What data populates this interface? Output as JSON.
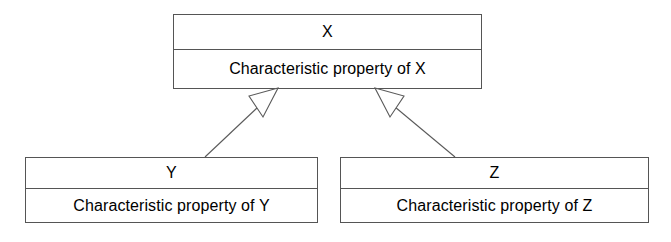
{
  "diagram": {
    "type": "uml-class-diagram",
    "relationship": "generalization",
    "background_color": "#ffffff",
    "line_color": "#5a5a5a",
    "text_color": "#000000",
    "classes": [
      {
        "id": "x",
        "name": "X",
        "attribute": "Characteristic property of X",
        "role": "superclass"
      },
      {
        "id": "y",
        "name": "Y",
        "attribute": "Characteristic property of Y",
        "role": "subclass"
      },
      {
        "id": "z",
        "name": "Z",
        "attribute": "Characteristic property of Z",
        "role": "subclass"
      }
    ],
    "connections": [
      {
        "id": "y-to-x",
        "from": "Y",
        "to": "X",
        "kind": "generalization",
        "arrowhead": "hollow-triangle"
      },
      {
        "id": "z-to-x",
        "from": "Z",
        "to": "X",
        "kind": "generalization",
        "arrowhead": "hollow-triangle"
      }
    ]
  }
}
